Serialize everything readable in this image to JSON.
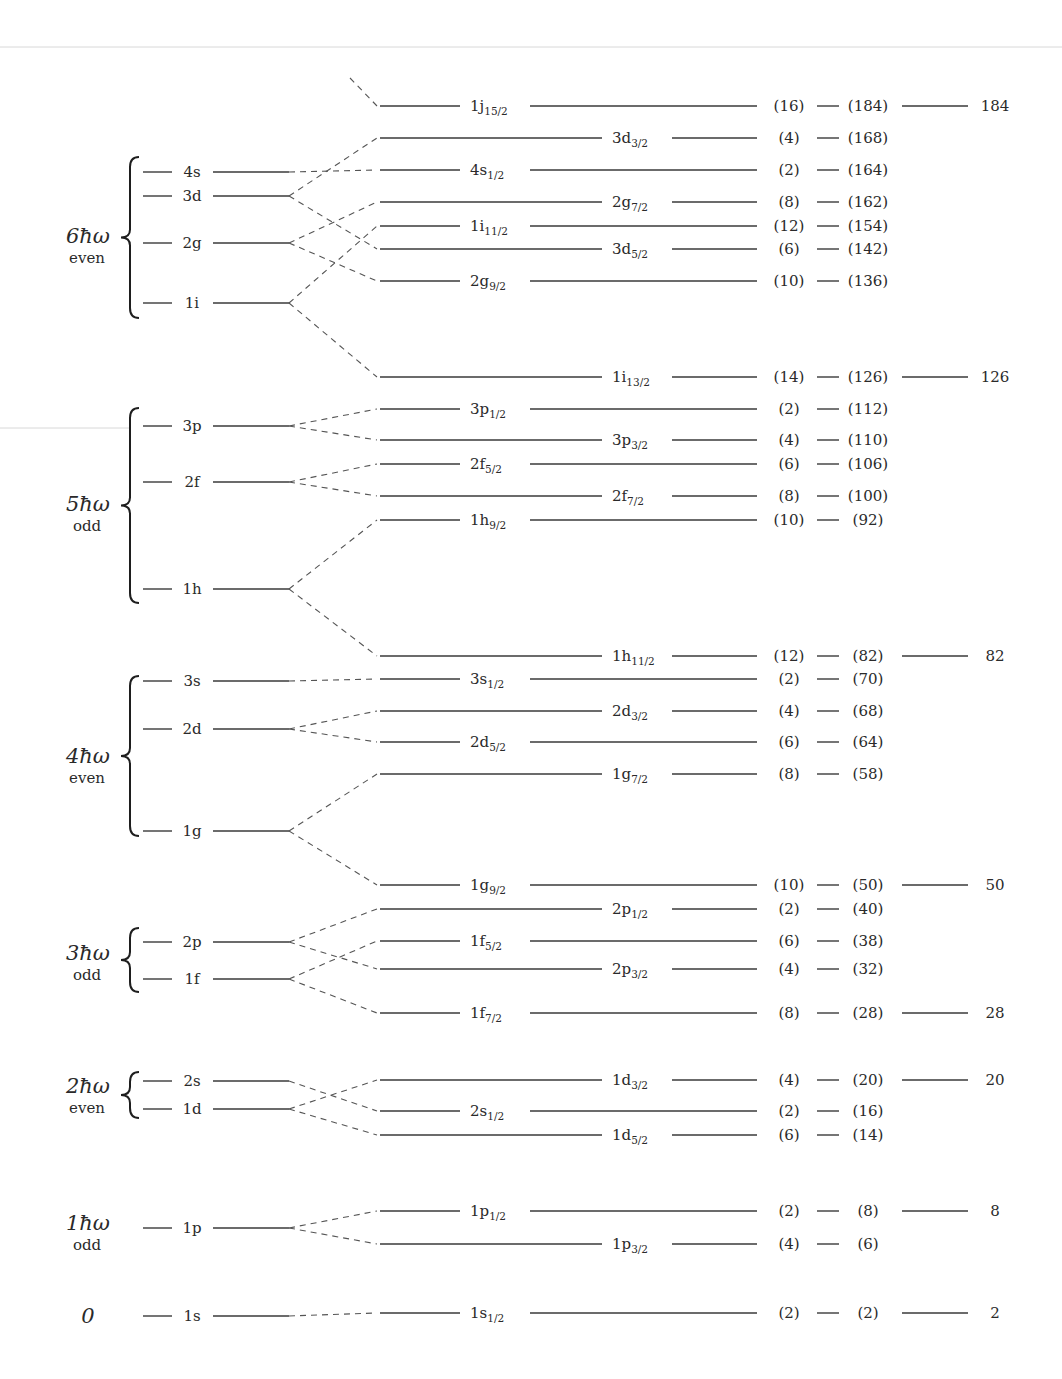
{
  "diagram": {
    "colors": {
      "line": "#3a3a3a",
      "text": "#2a2a2a",
      "background": "#ffffff"
    },
    "groups": [
      {
        "label": "0",
        "parity": "",
        "y": 1316,
        "brace": null
      },
      {
        "label": "1ħω",
        "parity": "odd",
        "y": 1232,
        "brace": null
      },
      {
        "label": "2ħω",
        "parity": "even",
        "y": 1095,
        "brace": [
          1072,
          1118
        ]
      },
      {
        "label": "3ħω",
        "parity": "odd",
        "y": 962,
        "brace": [
          928,
          992
        ]
      },
      {
        "label": "4ħω",
        "parity": "even",
        "y": 765,
        "brace": [
          676,
          836
        ]
      },
      {
        "label": "5ħω",
        "parity": "odd",
        "y": 513,
        "brace": [
          408,
          603
        ]
      },
      {
        "label": "6ħω",
        "parity": "even",
        "y": 245,
        "brace": [
          157,
          318
        ]
      }
    ],
    "oscillator_levels": [
      {
        "name": "1s",
        "y": 1316,
        "split": "single"
      },
      {
        "name": "1p",
        "y": 1228,
        "split": "pair"
      },
      {
        "name": "1d",
        "y": 1109,
        "split": "pair"
      },
      {
        "name": "2s",
        "y": 1081,
        "split": "single"
      },
      {
        "name": "1f",
        "y": 979,
        "split": "pair"
      },
      {
        "name": "2p",
        "y": 942,
        "split": "pair"
      },
      {
        "name": "1g",
        "y": 831,
        "split": "pair"
      },
      {
        "name": "2d",
        "y": 729,
        "split": "pair"
      },
      {
        "name": "3s",
        "y": 681,
        "split": "single"
      },
      {
        "name": "1h",
        "y": 589,
        "split": "pair"
      },
      {
        "name": "2f",
        "y": 482,
        "split": "pair"
      },
      {
        "name": "3p",
        "y": 426,
        "split": "pair"
      },
      {
        "name": "1i",
        "y": 303,
        "split": "pair"
      },
      {
        "name": "2g",
        "y": 243,
        "split": "pair"
      },
      {
        "name": "3d",
        "y": 196,
        "split": "pair"
      },
      {
        "name": "4s",
        "y": 172,
        "split": "single"
      }
    ],
    "sublevels": [
      {
        "base": "1s",
        "j": "1/2",
        "parent": "1s",
        "y": 1313,
        "label_pos": "left",
        "deg": "(2)",
        "cum": "(2)",
        "magic": "2"
      },
      {
        "base": "1p",
        "j": "3/2",
        "parent": "1p",
        "y": 1244,
        "label_pos": "right",
        "deg": "(4)",
        "cum": "(6)",
        "magic": ""
      },
      {
        "base": "1p",
        "j": "1/2",
        "parent": "1p",
        "y": 1211,
        "label_pos": "left",
        "deg": "(2)",
        "cum": "(8)",
        "magic": "8"
      },
      {
        "base": "1d",
        "j": "5/2",
        "parent": "1d",
        "y": 1135,
        "label_pos": "right",
        "deg": "(6)",
        "cum": "(14)",
        "magic": ""
      },
      {
        "base": "2s",
        "j": "1/2",
        "parent": "2s",
        "y": 1111,
        "label_pos": "left",
        "deg": "(2)",
        "cum": "(16)",
        "magic": ""
      },
      {
        "base": "1d",
        "j": "3/2",
        "parent": "1d",
        "y": 1080,
        "label_pos": "right",
        "deg": "(4)",
        "cum": "(20)",
        "magic": "20"
      },
      {
        "base": "1f",
        "j": "7/2",
        "parent": "1f",
        "y": 1013,
        "label_pos": "left",
        "deg": "(8)",
        "cum": "(28)",
        "magic": "28"
      },
      {
        "base": "2p",
        "j": "3/2",
        "parent": "2p",
        "y": 969,
        "label_pos": "right",
        "deg": "(4)",
        "cum": "(32)",
        "magic": ""
      },
      {
        "base": "1f",
        "j": "5/2",
        "parent": "1f",
        "y": 941,
        "label_pos": "left",
        "deg": "(6)",
        "cum": "(38)",
        "magic": ""
      },
      {
        "base": "2p",
        "j": "1/2",
        "parent": "2p",
        "y": 909,
        "label_pos": "right",
        "deg": "(2)",
        "cum": "(40)",
        "magic": ""
      },
      {
        "base": "1g",
        "j": "9/2",
        "parent": "1g",
        "y": 885,
        "label_pos": "left",
        "deg": "(10)",
        "cum": "(50)",
        "magic": "50"
      },
      {
        "base": "1g",
        "j": "7/2",
        "parent": "1g",
        "y": 774,
        "label_pos": "right",
        "deg": "(8)",
        "cum": "(58)",
        "magic": ""
      },
      {
        "base": "2d",
        "j": "5/2",
        "parent": "2d",
        "y": 742,
        "label_pos": "left",
        "deg": "(6)",
        "cum": "(64)",
        "magic": ""
      },
      {
        "base": "2d",
        "j": "3/2",
        "parent": "2d",
        "y": 711,
        "label_pos": "right",
        "deg": "(4)",
        "cum": "(68)",
        "magic": ""
      },
      {
        "base": "3s",
        "j": "1/2",
        "parent": "3s",
        "y": 679,
        "label_pos": "left",
        "deg": "(2)",
        "cum": "(70)",
        "magic": ""
      },
      {
        "base": "1h",
        "j": "11/2",
        "parent": "1h",
        "y": 656,
        "label_pos": "right",
        "deg": "(12)",
        "cum": "(82)",
        "magic": "82"
      },
      {
        "base": "1h",
        "j": "9/2",
        "parent": "1h",
        "y": 520,
        "label_pos": "left",
        "deg": "(10)",
        "cum": "(92)",
        "magic": ""
      },
      {
        "base": "2f",
        "j": "7/2",
        "parent": "2f",
        "y": 496,
        "label_pos": "right",
        "deg": "(8)",
        "cum": "(100)",
        "magic": ""
      },
      {
        "base": "2f",
        "j": "5/2",
        "parent": "2f",
        "y": 464,
        "label_pos": "left",
        "deg": "(6)",
        "cum": "(106)",
        "magic": ""
      },
      {
        "base": "3p",
        "j": "3/2",
        "parent": "3p",
        "y": 440,
        "label_pos": "right",
        "deg": "(4)",
        "cum": "(110)",
        "magic": ""
      },
      {
        "base": "3p",
        "j": "1/2",
        "parent": "3p",
        "y": 409,
        "label_pos": "left",
        "deg": "(2)",
        "cum": "(112)",
        "magic": ""
      },
      {
        "base": "1i",
        "j": "13/2",
        "parent": "1i",
        "y": 377,
        "label_pos": "right",
        "deg": "(14)",
        "cum": "(126)",
        "magic": "126"
      },
      {
        "base": "2g",
        "j": "9/2",
        "parent": "2g",
        "y": 281,
        "label_pos": "left",
        "deg": "(10)",
        "cum": "(136)",
        "magic": ""
      },
      {
        "base": "3d",
        "j": "5/2",
        "parent": "3d",
        "y": 249,
        "label_pos": "right",
        "deg": "(6)",
        "cum": "(142)",
        "magic": ""
      },
      {
        "base": "1i",
        "j": "11/2",
        "parent": "1i",
        "y": 226,
        "label_pos": "left",
        "deg": "(12)",
        "cum": "(154)",
        "magic": ""
      },
      {
        "base": "2g",
        "j": "7/2",
        "parent": "2g",
        "y": 202,
        "label_pos": "right",
        "deg": "(8)",
        "cum": "(162)",
        "magic": ""
      },
      {
        "base": "4s",
        "j": "1/2",
        "parent": "4s",
        "y": 170,
        "label_pos": "left",
        "deg": "(2)",
        "cum": "(164)",
        "magic": ""
      },
      {
        "base": "3d",
        "j": "3/2",
        "parent": "3d",
        "y": 138,
        "label_pos": "right",
        "deg": "(4)",
        "cum": "(168)",
        "magic": ""
      },
      {
        "base": "1j",
        "j": "15/2",
        "parent": "1j",
        "y": 106,
        "label_pos": "left",
        "deg": "(16)",
        "cum": "(184)",
        "magic": "184"
      }
    ],
    "magic_numbers": [
      "2",
      "8",
      "20",
      "28",
      "50",
      "82",
      "126",
      "184"
    ]
  }
}
